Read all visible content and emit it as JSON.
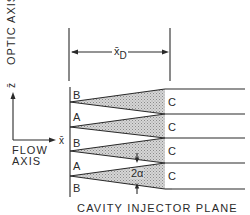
{
  "diagram": {
    "title": "CAVITY INJECTOR PLANE",
    "axes": {
      "optic_axis_label": "OPTIC AXIS",
      "optic_axis_symbol": "z̄",
      "flow_axis_label_line1": "FLOW",
      "flow_axis_label_line2": "AXIS",
      "flow_axis_symbol": "x̄"
    },
    "dimension": {
      "symbol": "x̄",
      "subscript": "D"
    },
    "regions": {
      "left": [
        "B",
        "A",
        "B",
        "A",
        "B"
      ],
      "right": [
        "C",
        "C",
        "C",
        "C"
      ]
    },
    "angle_label": "2α",
    "colors": {
      "line": "#2a2a2a",
      "shading": "#bdbdbd",
      "background": "#ffffff"
    }
  }
}
